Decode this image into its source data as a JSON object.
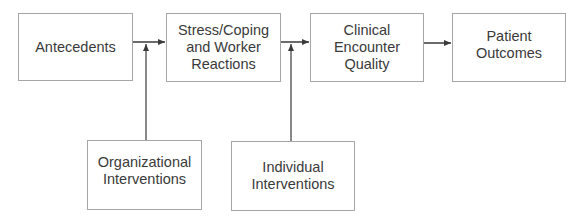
{
  "diagram": {
    "nodes": [
      {
        "id": "antecedents",
        "label": "Antecedents"
      },
      {
        "id": "stress",
        "label": "Stress/Coping\nand Worker\nReactions"
      },
      {
        "id": "clinical",
        "label": "Clinical\nEncounter\nQuality"
      },
      {
        "id": "patient",
        "label": "Patient\nOutcomes"
      },
      {
        "id": "organizational",
        "label": "Organizational\nInterventions"
      },
      {
        "id": "individual",
        "label": "Individual\nInterventions"
      }
    ],
    "edges": [
      {
        "from": "antecedents",
        "to": "stress"
      },
      {
        "from": "stress",
        "to": "clinical"
      },
      {
        "from": "clinical",
        "to": "patient"
      },
      {
        "from": "organizational",
        "to": "antecedents-stress-edge"
      },
      {
        "from": "individual",
        "to": "stress-clinical-edge"
      }
    ],
    "colors": {
      "line": "#3a3a3a",
      "border": "#a6a6a6",
      "text": "#3a3a3a"
    }
  }
}
